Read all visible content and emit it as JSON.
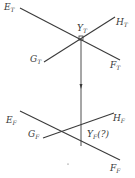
{
  "diagram": {
    "type": "descriptive-geometry-projection",
    "line_color": "#3a3a3a",
    "top_view": {
      "labels": {
        "E": {
          "base": "E",
          "sub": "T"
        },
        "H": {
          "base": "H",
          "sub": "T"
        },
        "G": {
          "base": "G",
          "sub": "T"
        },
        "F": {
          "base": "F",
          "sub": "T"
        },
        "Y": {
          "base": "Y",
          "sub": "T"
        }
      }
    },
    "front_view": {
      "labels": {
        "E": {
          "base": "E",
          "sub": "F"
        },
        "H": {
          "base": "H",
          "sub": "F"
        },
        "G": {
          "base": "G",
          "sub": "F"
        },
        "F": {
          "base": "F",
          "sub": "F"
        },
        "Y": {
          "base": "Y",
          "sub": "F",
          "suffix": "(?)"
        }
      }
    }
  }
}
